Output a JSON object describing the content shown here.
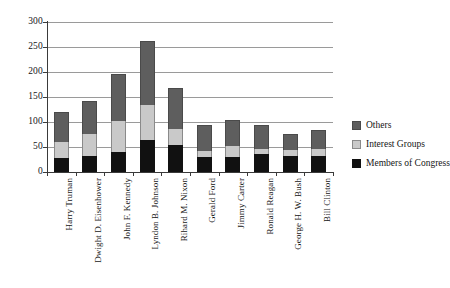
{
  "chart_data": {
    "type": "bar",
    "subtype": "stacked-vertical",
    "title": "",
    "xlabel": "",
    "ylabel": "",
    "ylim": [
      0,
      300
    ],
    "yticks": [
      0,
      50,
      100,
      150,
      200,
      250,
      300
    ],
    "ytick_labels": [
      "0",
      "50",
      "100",
      "150",
      "200",
      "250",
      "300"
    ],
    "grid": true,
    "grid_axis": "y",
    "legend_position": "right",
    "categories": [
      "Harry Truman",
      "Dwight D. Eisenhower",
      "John F. Kennedy",
      "Lyndon B. Johnson",
      "Rihard M. Nixon",
      "Gerald Ford",
      "Jimmy Carter",
      "Ronald Reagan",
      "George H. W. Bush",
      "Bill Clinton"
    ],
    "series": [
      {
        "name": "Members of Congress",
        "color": "#111111",
        "values": [
          28,
          33,
          41,
          64,
          55,
          30,
          31,
          36,
          32,
          32
        ]
      },
      {
        "name": "Interest Groups",
        "color": "#c9c9c9",
        "values": [
          32,
          43,
          61,
          71,
          32,
          12,
          21,
          10,
          12,
          14
        ]
      },
      {
        "name": "Others",
        "color": "#5e5e5e",
        "values": [
          60,
          67,
          94,
          127,
          81,
          52,
          52,
          48,
          32,
          39
        ]
      }
    ],
    "totals": [
      120,
      143,
      196,
      262,
      168,
      94,
      104,
      94,
      76,
      85
    ],
    "legend": [
      {
        "label": "Others",
        "color": "#5e5e5e"
      },
      {
        "label": "Interest Groups",
        "color": "#c9c9c9"
      },
      {
        "label": "Members of Congress",
        "color": "#111111"
      }
    ]
  }
}
